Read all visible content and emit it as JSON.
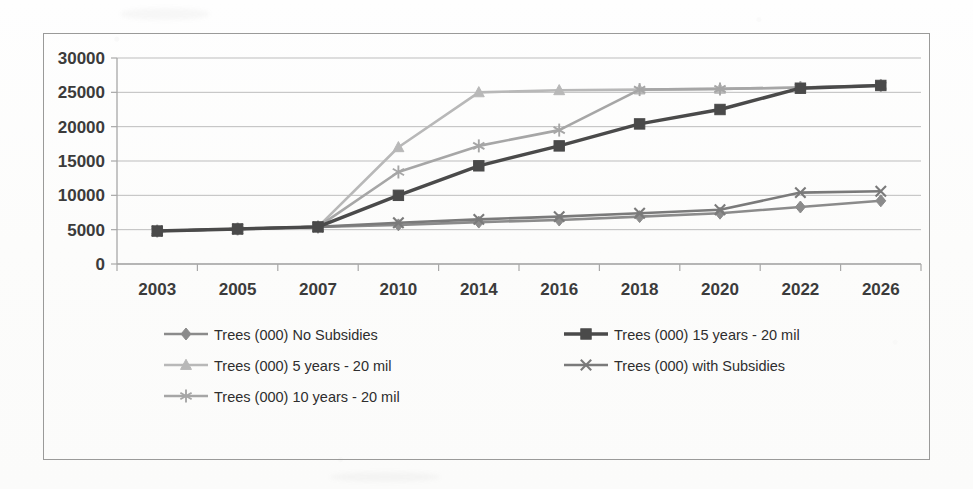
{
  "chart_data": {
    "type": "line",
    "title": "",
    "subtitle": "",
    "xlabel": "",
    "ylabel": "",
    "categories": [
      "2003",
      "2005",
      "2007",
      "2010",
      "2014",
      "2016",
      "2018",
      "2020",
      "2022",
      "2026"
    ],
    "ylim": [
      0,
      30000
    ],
    "ytick_values": [
      0,
      5000,
      10000,
      15000,
      20000,
      25000,
      30000
    ],
    "ytick_labels": [
      "0",
      "5000",
      "10000",
      "15000",
      "20000",
      "25000",
      "30000"
    ],
    "grid": true,
    "legend_position": "bottom",
    "series": [
      {
        "name": "Trees (000) No Subsidies",
        "marker": "diamond",
        "color": "#8b8b8b",
        "values": [
          4800,
          5100,
          5400,
          5700,
          6100,
          6400,
          6900,
          7400,
          8300,
          9200
        ]
      },
      {
        "name": "Trees (000) 5 years - 20 mil",
        "marker": "triangle",
        "color": "#b8b8b8",
        "values": [
          4800,
          5100,
          5400,
          17000,
          25000,
          25300,
          25400,
          25500,
          25700,
          26000
        ]
      },
      {
        "name": "Trees (000) 10 years - 20 mil",
        "marker": "star",
        "color": "#a6a6a6",
        "values": [
          4800,
          5100,
          5400,
          13400,
          17200,
          19500,
          25400,
          25500,
          25700,
          26000
        ]
      },
      {
        "name": "Trees (000) 15 years - 20 mil",
        "marker": "square",
        "color": "#4a4a4a",
        "values": [
          4800,
          5100,
          5400,
          10000,
          14300,
          17200,
          20400,
          22500,
          25600,
          26000
        ]
      },
      {
        "name": "Trees (000) with Subsidies",
        "marker": "x",
        "color": "#7a7a7a",
        "values": [
          4800,
          5100,
          5400,
          6000,
          6500,
          6900,
          7400,
          7900,
          10400,
          10600
        ]
      }
    ]
  },
  "legend": {
    "items": [
      {
        "label": "Trees (000) No Subsidies",
        "marker": "diamond",
        "color": "#8b8b8b",
        "column": 0,
        "row": 0
      },
      {
        "label": "Trees (000) 15 years - 20 mil",
        "marker": "square",
        "color": "#4a4a4a",
        "column": 1,
        "row": 0
      },
      {
        "label": "Trees (000) 5 years - 20 mil",
        "marker": "triangle",
        "color": "#b8b8b8",
        "column": 0,
        "row": 1
      },
      {
        "label": "Trees (000) with Subsidies",
        "marker": "x",
        "color": "#7a7a7a",
        "column": 1,
        "row": 1
      },
      {
        "label": "Trees (000) 10 years - 20 mil",
        "marker": "star",
        "color": "#a6a6a6",
        "column": 0,
        "row": 2
      }
    ]
  },
  "colors": {
    "frame_border": "#9a9a99",
    "gridline": "#bdbdbd",
    "axis_line": "#a8a8a8",
    "tick_label": "#3b3b3b",
    "legend_label": "#2e2e2e",
    "background": "#fdfdfc"
  }
}
